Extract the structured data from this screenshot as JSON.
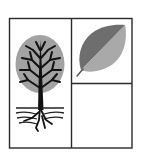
{
  "figure": {
    "width": 142,
    "height": 154,
    "background": "#ffffff",
    "frame": {
      "x": 9.5,
      "y": 18.5,
      "w": 122.5,
      "h": 129.5,
      "stroke": "#2a2a2a",
      "stroke_width": 1.4
    },
    "dividers": {
      "vertical_x": 71.5,
      "horizontal_y": 83.5,
      "stroke": "#2a2a2a"
    },
    "panels": [
      {
        "id": "tree",
        "label": "",
        "icon": "tree-with-roots-icon"
      },
      {
        "id": "leaf",
        "label": "",
        "icon": "leaf-icon"
      },
      {
        "id": "empty",
        "label": "",
        "icon": ""
      }
    ],
    "colors": {
      "canopy": "#a2a2a2",
      "branches": "#111111",
      "leaf_dark": "#6e6e6e",
      "leaf_light": "#a9a9a9",
      "lines": "#2a2a2a"
    }
  }
}
